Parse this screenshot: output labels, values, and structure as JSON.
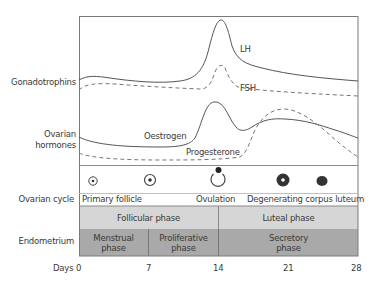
{
  "row_labels": {
    "gonadotrophins": "Gonadotrophins",
    "ovarian_hormones_line1": "Ovarian",
    "ovarian_hormones_line2": "hormones",
    "ovarian_cycle": "Ovarian cycle",
    "endometrium": "Endometrium",
    "days": "Days"
  },
  "curve_labels": {
    "lh": "LH",
    "fsh": "FSH",
    "oestrogen": "Oestrogen",
    "progesterone": "Progesterone"
  },
  "ovarian_cycle": {
    "icons": [
      "primary-follicle-icon",
      "growing-follicle-icon",
      "ovulation-icon",
      "corpus-luteum-icon",
      "degenerating-corpus-luteum-icon"
    ],
    "labels": {
      "primary_follicle": "Primary follicle",
      "ovulation": "Ovulation",
      "degenerating": "Degenerating corpus luteum"
    }
  },
  "phases": {
    "follicular": "Follicular phase",
    "luteal": "Luteal phase"
  },
  "endometrium": {
    "menstrual_1": "Menstrual",
    "menstrual_2": "phase",
    "proliferative_1": "Proliferative",
    "proliferative_2": "phase",
    "secretory_1": "Secretory",
    "secretory_2": "phase"
  },
  "days_axis": [
    "0",
    "7",
    "14",
    "21",
    "28"
  ],
  "colors": {
    "light_band": "#d6d6d6",
    "dark_band": "#a9a9a9",
    "line": "#555555"
  }
}
